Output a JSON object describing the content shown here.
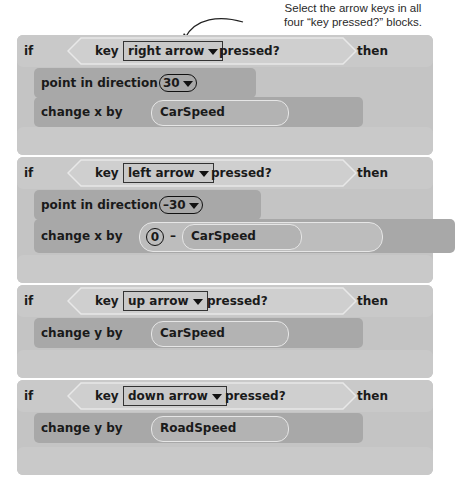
{
  "annotation": {
    "line1": "Select the arrow keys in all",
    "line2": "four “key pressed?” blocks."
  },
  "colors": {
    "control_block": "#c4c4c4",
    "motion_block": "#a8a8a8",
    "reporter_outline": "#e6e6e6"
  },
  "blocks": [
    {
      "if_label": "if",
      "key_label": "key",
      "key_value": "right arrow",
      "pressed_label": "pressed?",
      "then_label": "then",
      "statements": [
        {
          "label": "point in direction",
          "value": "30"
        },
        {
          "label": "change x by",
          "reporter": "CarSpeed"
        }
      ]
    },
    {
      "if_label": "if",
      "key_label": "key",
      "key_value": "left arrow",
      "pressed_label": "pressed?",
      "then_label": "then",
      "statements": [
        {
          "label": "point in direction",
          "value": "–30"
        },
        {
          "label": "change x by",
          "operand": "0",
          "operator": "–",
          "reporter": "CarSpeed"
        }
      ]
    },
    {
      "if_label": "if",
      "key_label": "key",
      "key_value": "up arrow",
      "pressed_label": "pressed?",
      "then_label": "then",
      "statements": [
        {
          "label": "change y by",
          "reporter": "CarSpeed"
        }
      ]
    },
    {
      "if_label": "if",
      "key_label": "key",
      "key_value": "down arrow",
      "pressed_label": "pressed?",
      "then_label": "then",
      "statements": [
        {
          "label": "change y by",
          "reporter": "RoadSpeed"
        }
      ]
    }
  ]
}
